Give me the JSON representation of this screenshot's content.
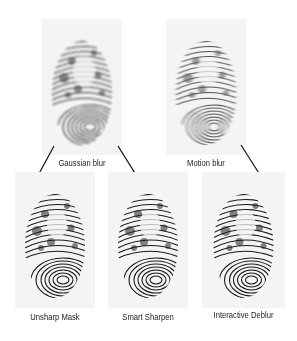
{
  "diagram": {
    "type": "image-processing-flow",
    "background": "#ffffff",
    "panel_background": "#f4f4f4",
    "ink_color": "#1a1a1a",
    "top_row": [
      {
        "id": "gaussian",
        "label": "Gaussian blur",
        "image": "blurred-fingerprint-gaussian"
      },
      {
        "id": "motion",
        "label": "Motion blur",
        "image": "blurred-fingerprint-motion"
      }
    ],
    "bottom_row": [
      {
        "id": "unsharp",
        "label": "Unsharp Mask",
        "image": "sharpened-fingerprint-unsharp-mask"
      },
      {
        "id": "smart",
        "label": "Smart Sharpen",
        "image": "sharpened-fingerprint-smart-sharpen"
      },
      {
        "id": "deblur",
        "label": "Interactive Deblur",
        "image": "sharpened-fingerprint-interactive-deblur"
      }
    ],
    "connections": [
      {
        "from": "Gaussian blur",
        "to": "Unsharp Mask"
      },
      {
        "from": "Gaussian blur",
        "to": "Smart Sharpen"
      },
      {
        "from": "Motion blur",
        "to": "Interactive Deblur"
      }
    ]
  }
}
